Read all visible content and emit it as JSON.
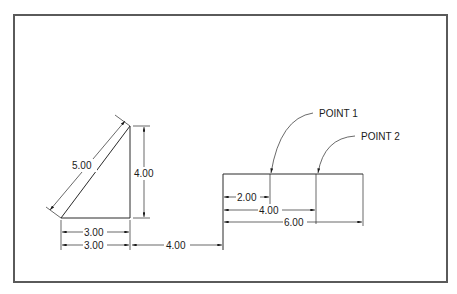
{
  "figure": {
    "type": "dimensioned technical drawing",
    "colors": {
      "line": "#2a2a2a",
      "frame": "#5a5a5a",
      "background": "#ffffff"
    }
  },
  "triangle": {
    "hypotenuse_label": "5.00",
    "height_label": "4.00",
    "base_label": "3.00",
    "base_baseline_label": "3.00"
  },
  "gap": {
    "label": "4.00"
  },
  "rectangle": {
    "callouts": [
      {
        "label": "POINT 1"
      },
      {
        "label": "POINT 2"
      }
    ],
    "dims": [
      {
        "label": "2.00"
      },
      {
        "label": "4.00"
      },
      {
        "label": "6.00"
      }
    ]
  }
}
